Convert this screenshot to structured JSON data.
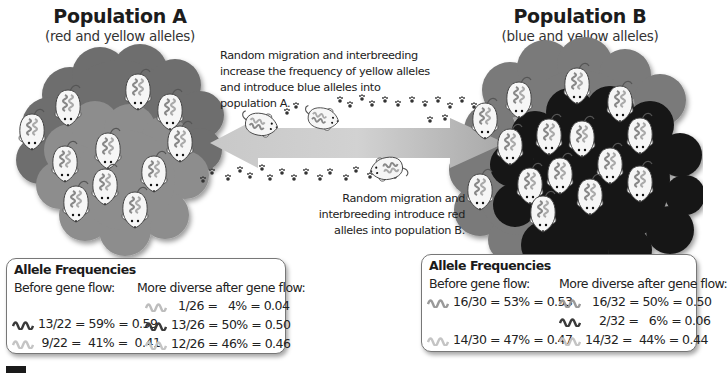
{
  "population_a": {
    "title": "Population A",
    "subtitle": "(red and yellow alleles)"
  },
  "population_b": {
    "title": "Population B",
    "subtitle": "(blue and yellow alleles)"
  },
  "captions": {
    "top": [
      "Random migration and interbreeding",
      "increase the frequency of yellow alleles",
      "and introduce blue alleles into",
      "population A."
    ],
    "bottom": [
      "Random migration and",
      "interbreeding introduce red",
      "alleles into population B."
    ]
  },
  "freq_a": {
    "title": "Allele Frequencies",
    "before_label": "Before gene flow:",
    "after_label": "More diverse after gene flow:",
    "before": [
      {
        "allele": "red",
        "text": "13/22 = 59% = 0.59"
      },
      {
        "allele": "yellow",
        "text": " 9/22 =  41% =  0.41"
      }
    ],
    "after": [
      {
        "allele": "blue",
        "text": "  1/26 =   4% = 0.04"
      },
      {
        "allele": "red",
        "text": "13/26 = 50% = 0.50"
      },
      {
        "allele": "yellow",
        "text": "12/26 = 46% = 0.46"
      }
    ]
  },
  "freq_b": {
    "title": "Allele Frequencies",
    "before_label": "Before gene flow:",
    "after_label": "More diverse after gene flow:",
    "before": [
      {
        "allele": "blue",
        "text": "16/30 = 53% = 0.53"
      },
      {
        "allele": "yellow",
        "text": "14/30 = 47% = 0.47"
      }
    ],
    "after": [
      {
        "allele": "blue",
        "text": "  16/32 = 50% = 0.50"
      },
      {
        "allele": "red",
        "text": "    2/32 =   6% = 0.06"
      },
      {
        "allele": "yellow",
        "text": "14/32 =  44% = 0.44"
      }
    ]
  },
  "colors": {
    "red_allele": "#4a4a4a",
    "yellow_allele": "#c4c4c4",
    "blue_allele": "#9a9a9a",
    "cloud_a_back": "#707070",
    "cloud_a_front": "#8e8e8e",
    "cloud_b_back": "#7a7a7a",
    "cloud_b_front": "#141414",
    "arrow": "#b9b9b9"
  }
}
